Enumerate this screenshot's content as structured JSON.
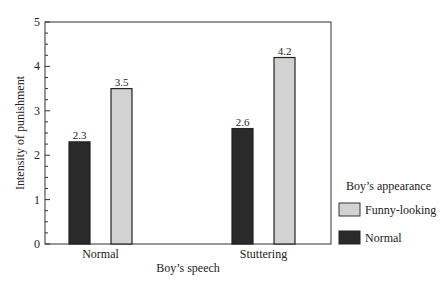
{
  "chart_data": {
    "type": "bar",
    "title": "",
    "xlabel": "Boy’s speech",
    "ylabel": "Intensity of punishment",
    "categories": [
      "Normal",
      "Stuttering"
    ],
    "series": [
      {
        "name": "Normal",
        "values": [
          2.3,
          2.6
        ],
        "color": "#2a2a2a"
      },
      {
        "name": "Funny-looking",
        "values": [
          3.5,
          4.2
        ],
        "color": "#d2d2d2"
      }
    ],
    "data_labels": [
      [
        "2.3",
        "2.6"
      ],
      [
        "3.5",
        "4.2"
      ]
    ],
    "ylim": [
      0,
      5
    ],
    "yticks": [
      "0",
      "1",
      "2",
      "3",
      "4",
      "5"
    ],
    "grid": false,
    "legend": {
      "title": "Boy’s appearance",
      "position": "right",
      "entries": [
        "Funny-looking",
        "Normal"
      ]
    }
  }
}
